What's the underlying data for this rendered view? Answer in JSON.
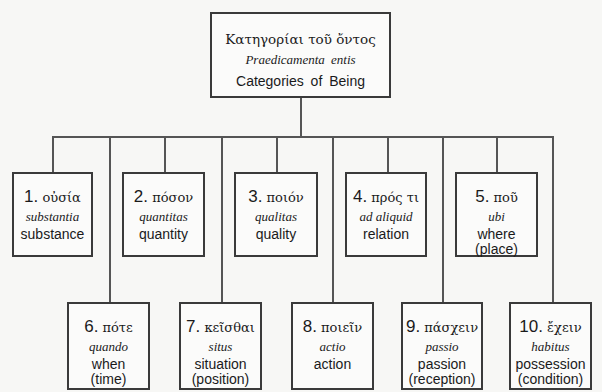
{
  "root": {
    "greek": "Κατηγορίαι τοῦ ὄντος",
    "latin": "Praedicamenta entis",
    "english": "Categories of Being"
  },
  "categories": [
    {
      "number": "1.",
      "greek": "οὐσία",
      "latin": "substantia",
      "english": "substance"
    },
    {
      "number": "2.",
      "greek": "πόσον",
      "latin": "quantitas",
      "english": "quantity"
    },
    {
      "number": "3.",
      "greek": "ποιόν",
      "latin": "qualitas",
      "english": "quality"
    },
    {
      "number": "4.",
      "greek": "πρός τι",
      "latin": "ad aliquid",
      "english": "relation"
    },
    {
      "number": "5.",
      "greek": "ποῦ",
      "latin": "ubi",
      "english": "where\n(place)"
    },
    {
      "number": "6.",
      "greek": "πότε",
      "latin": "quando",
      "english": "when\n(time)"
    },
    {
      "number": "7.",
      "greek": "κεῖσθαι",
      "latin": "situs",
      "english": "situation\n(position)"
    },
    {
      "number": "8.",
      "greek": "ποιεῖν",
      "latin": "actio",
      "english": "action"
    },
    {
      "number": "9.",
      "greek": "πάσχειν",
      "latin": "passio",
      "english": "passion\n(reception)"
    },
    {
      "number": "10.",
      "greek": "ἔχειν",
      "latin": "habitus",
      "english": "possession\n(condition)"
    }
  ],
  "colors": {
    "border": "#3a3a3a",
    "connector": "#555555",
    "background": "#f7f7f5"
  }
}
